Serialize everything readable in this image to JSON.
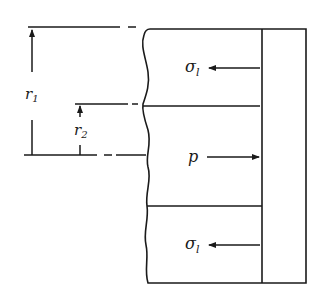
{
  "diagram": {
    "labels": {
      "r1": {
        "main": "r",
        "sub": "1"
      },
      "r2": {
        "main": "r",
        "sub": "2"
      },
      "sigma_top": {
        "main": "σ",
        "sub": "l"
      },
      "pressure": {
        "main": "p"
      },
      "sigma_bottom": {
        "main": "σ",
        "sub": "l"
      }
    },
    "colors": {
      "line": "#1a1a1a",
      "background": "#ffffff"
    }
  }
}
